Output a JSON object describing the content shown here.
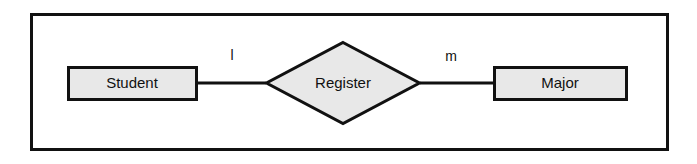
{
  "diagram": {
    "type": "entity-relationship-diagram",
    "title": "",
    "canvas": {
      "width": 697,
      "height": 164,
      "background": "#ffffff"
    },
    "frame": {
      "x": 30,
      "y": 13,
      "width": 638,
      "height": 137,
      "stroke": "#111111",
      "stroke_width": 3,
      "fill": "#ffffff"
    },
    "style": {
      "shape_fill": "#e8e8e8",
      "shape_stroke": "#111111",
      "shape_stroke_width": 3,
      "line_stroke": "#111111",
      "line_stroke_width": 3,
      "text_color": "#111111"
    },
    "entities": [
      {
        "id": "student",
        "label": "Student",
        "shape": "rectangle",
        "x": 67,
        "y": 66,
        "width": 130,
        "height": 34,
        "center_x": 132,
        "center_y": 83
      },
      {
        "id": "major",
        "label": "Major",
        "shape": "rectangle",
        "x": 493,
        "y": 66,
        "width": 134,
        "height": 34,
        "center_x": 560,
        "center_y": 83
      }
    ],
    "relationships": [
      {
        "id": "register",
        "label": "Register",
        "shape": "diamond",
        "center_x": 343,
        "center_y": 83,
        "half_width": 78,
        "half_height": 42,
        "points": "343,41 421,83 343,125 265,83"
      }
    ],
    "connectors": [
      {
        "id": "student-register",
        "from": "student",
        "to": "register",
        "x1": 197,
        "y1": 83,
        "x2": 266,
        "y2": 83,
        "cardinality": "l",
        "cardinality_x": 232,
        "cardinality_y": 56
      },
      {
        "id": "register-major",
        "from": "register",
        "to": "major",
        "x1": 420,
        "y1": 83,
        "x2": 494,
        "y2": 83,
        "cardinality": "m",
        "cardinality_x": 451,
        "cardinality_y": 57
      }
    ]
  }
}
